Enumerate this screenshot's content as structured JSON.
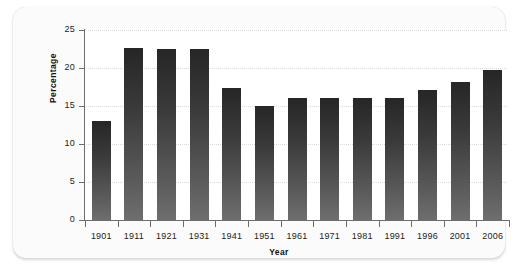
{
  "chart_data": {
    "type": "bar",
    "title": "",
    "xlabel": "Year",
    "ylabel": "Percentage",
    "categories": [
      "1901",
      "1911",
      "1921",
      "1931",
      "1941",
      "1951",
      "1961",
      "1971",
      "1981",
      "1991",
      "1996",
      "2001",
      "2006"
    ],
    "values": [
      13.0,
      22.6,
      22.5,
      22.5,
      17.4,
      15.0,
      16.0,
      16.0,
      16.0,
      16.0,
      17.1,
      18.1,
      19.7
    ],
    "ylim": [
      0,
      25
    ],
    "yticks": [
      0,
      5,
      10,
      15,
      20,
      25
    ],
    "ytick_labels": [
      "0",
      "5",
      "10",
      "15",
      "20",
      "25"
    ],
    "grid": true,
    "grid_axis": "y",
    "legend": "none",
    "bar_color_top": "#262626",
    "bar_color_bottom": "#6e6e6e",
    "grid_color": "#dadada",
    "axis_color": "#6d6d6d",
    "plot_background": "#ffffff",
    "panel_background": "#fbfbfb"
  }
}
